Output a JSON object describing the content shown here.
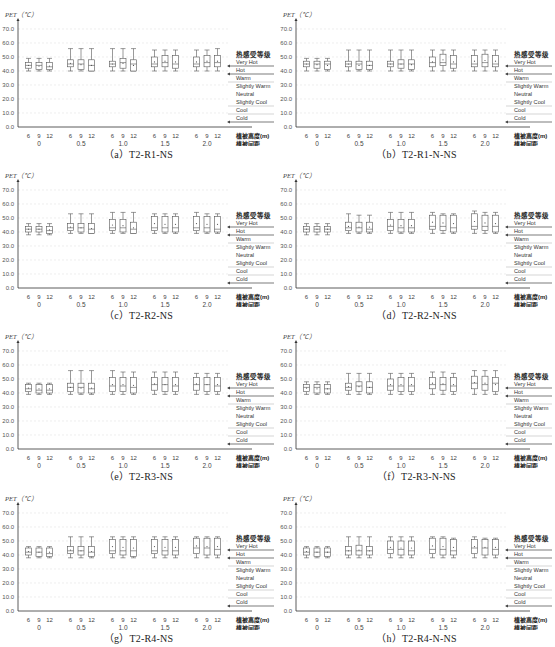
{
  "figure": {
    "y_axis_label": "PET（℃）",
    "y_ticks": [
      "0.0",
      "10.0",
      "20.0",
      "30.0",
      "40.0",
      "50.0",
      "60.0",
      "70.0"
    ],
    "x_sub_ticks": [
      "6",
      "9",
      "12"
    ],
    "x_groups": [
      "0",
      "0.5",
      "1.0",
      "1.5",
      "2.0"
    ],
    "x_label_height": "植被高度(m)",
    "x_label_spacing": "植被间距",
    "legend": {
      "title": "热感受等级",
      "levels": [
        "Very Hot",
        "Hot",
        "Warm",
        "Slightly Warm",
        "Neutral",
        "Slightly Cool",
        "Cool",
        "Cold"
      ]
    },
    "colors": {
      "box": "#555555",
      "axis": "#333333",
      "grid": "#e2e2e2",
      "legend_line": "#444444"
    }
  },
  "chart_data": [
    {
      "type": "boxplot",
      "title": "（a）T2-R1-NS",
      "ylabel": "PET（℃）",
      "ylim": [
        0,
        70
      ],
      "groups": [
        "0",
        "0.5",
        "1.0",
        "1.5",
        "2.0"
      ],
      "subgroups": [
        "6",
        "9",
        "12"
      ],
      "boxes": [
        [
          [
            40,
            42,
            44,
            46,
            49
          ],
          [
            40,
            41,
            44,
            46,
            49
          ],
          [
            40,
            41,
            43,
            46,
            49
          ]
        ],
        [
          [
            40,
            43,
            45,
            48,
            56
          ],
          [
            40,
            41,
            45,
            48,
            56
          ],
          [
            40,
            40,
            44,
            48,
            56
          ]
        ],
        [
          [
            40,
            43,
            45,
            47,
            56
          ],
          [
            40,
            42,
            46,
            49,
            56
          ],
          [
            40,
            40,
            45,
            48,
            56
          ]
        ],
        [
          [
            40,
            43,
            45,
            50,
            55
          ],
          [
            40,
            43,
            46,
            51,
            55
          ],
          [
            40,
            42,
            45,
            51,
            55
          ]
        ],
        [
          [
            40,
            43,
            45,
            50,
            55
          ],
          [
            40,
            43,
            46,
            51,
            55
          ],
          [
            40,
            43,
            46,
            51,
            56
          ]
        ]
      ]
    },
    {
      "type": "boxplot",
      "title": "（b）T2-R1-N-NS",
      "ylabel": "PET（℃）",
      "ylim": [
        0,
        70
      ],
      "groups": [
        "0",
        "0.5",
        "1.0",
        "1.5",
        "2.0"
      ],
      "subgroups": [
        "6",
        "9",
        "12"
      ],
      "boxes": [
        [
          [
            40,
            43,
            45,
            47,
            49
          ],
          [
            40,
            42,
            45,
            47,
            49
          ],
          [
            40,
            41,
            45,
            47,
            49
          ]
        ],
        [
          [
            40,
            43,
            45,
            47,
            55
          ],
          [
            40,
            41,
            45,
            47,
            55
          ],
          [
            40,
            41,
            44,
            47,
            55
          ]
        ],
        [
          [
            40,
            43,
            45,
            47,
            55
          ],
          [
            40,
            42,
            45,
            48,
            55
          ],
          [
            40,
            41,
            45,
            48,
            55
          ]
        ],
        [
          [
            40,
            43,
            46,
            50,
            55
          ],
          [
            40,
            44,
            46,
            52,
            55
          ],
          [
            40,
            42,
            45,
            51,
            55
          ]
        ],
        [
          [
            40,
            43,
            45,
            51,
            55
          ],
          [
            40,
            43,
            46,
            52,
            55
          ],
          [
            40,
            43,
            45,
            51,
            55
          ]
        ]
      ]
    },
    {
      "type": "boxplot",
      "title": "（c）T2-R2-NS",
      "ylabel": "PET（℃）",
      "ylim": [
        0,
        70
      ],
      "groups": [
        "0",
        "0.5",
        "1.0",
        "1.5",
        "2.0"
      ],
      "subgroups": [
        "6",
        "9",
        "12"
      ],
      "boxes": [
        [
          [
            38,
            40,
            42,
            44,
            46
          ],
          [
            38,
            40,
            42,
            44,
            46
          ],
          [
            38,
            39,
            41,
            44,
            46
          ]
        ],
        [
          [
            39,
            41,
            43,
            46,
            53
          ],
          [
            39,
            40,
            43,
            46,
            53
          ],
          [
            39,
            39,
            42,
            46,
            53
          ]
        ],
        [
          [
            39,
            41,
            43,
            49,
            54
          ],
          [
            39,
            40,
            43,
            49,
            54
          ],
          [
            39,
            39,
            42,
            47,
            54
          ]
        ],
        [
          [
            39,
            41,
            43,
            51,
            53
          ],
          [
            39,
            40,
            43,
            51,
            53
          ],
          [
            39,
            40,
            43,
            51,
            53
          ]
        ],
        [
          [
            39,
            41,
            43,
            51,
            54
          ],
          [
            39,
            40,
            43,
            51,
            53
          ],
          [
            39,
            40,
            42,
            51,
            53
          ]
        ]
      ]
    },
    {
      "type": "boxplot",
      "title": "（d）T2-R2-N-NS",
      "ylabel": "PET（℃）",
      "ylim": [
        0,
        70
      ],
      "groups": [
        "0",
        "0.5",
        "1.0",
        "1.5",
        "2.0"
      ],
      "subgroups": [
        "6",
        "9",
        "12"
      ],
      "boxes": [
        [
          [
            38,
            40,
            42,
            44,
            46
          ],
          [
            38,
            40,
            42,
            44,
            46
          ],
          [
            38,
            40,
            42,
            44,
            46
          ]
        ],
        [
          [
            39,
            41,
            43,
            47,
            53
          ],
          [
            39,
            40,
            43,
            47,
            52
          ],
          [
            39,
            40,
            42,
            47,
            52
          ]
        ],
        [
          [
            39,
            41,
            44,
            49,
            54
          ],
          [
            39,
            40,
            43,
            49,
            54
          ],
          [
            39,
            40,
            43,
            49,
            54
          ]
        ],
        [
          [
            39,
            42,
            44,
            52,
            54
          ],
          [
            39,
            41,
            44,
            52,
            53
          ],
          [
            39,
            40,
            43,
            52,
            53
          ]
        ],
        [
          [
            39,
            42,
            44,
            53,
            55
          ],
          [
            39,
            41,
            44,
            52,
            54
          ],
          [
            39,
            40,
            44,
            52,
            54
          ]
        ]
      ]
    },
    {
      "type": "boxplot",
      "title": "（e）T2-R3-NS",
      "ylabel": "PET（℃）",
      "ylim": [
        0,
        70
      ],
      "groups": [
        "0",
        "0.5",
        "1.0",
        "1.5",
        "2.0"
      ],
      "subgroups": [
        "6",
        "9",
        "12"
      ],
      "boxes": [
        [
          [
            39,
            41,
            43,
            46,
            47
          ],
          [
            39,
            40,
            42,
            46,
            47
          ],
          [
            39,
            40,
            42,
            46,
            47
          ]
        ],
        [
          [
            39,
            41,
            44,
            47,
            56
          ],
          [
            39,
            40,
            44,
            47,
            56
          ],
          [
            39,
            40,
            43,
            47,
            56
          ]
        ],
        [
          [
            39,
            41,
            45,
            51,
            56
          ],
          [
            39,
            41,
            45,
            51,
            55
          ],
          [
            39,
            40,
            44,
            51,
            55
          ]
        ],
        [
          [
            39,
            42,
            46,
            51,
            55
          ],
          [
            39,
            41,
            46,
            51,
            55
          ],
          [
            39,
            41,
            45,
            51,
            55
          ]
        ],
        [
          [
            39,
            42,
            46,
            51,
            54
          ],
          [
            39,
            41,
            46,
            51,
            54
          ],
          [
            39,
            41,
            45,
            51,
            54
          ]
        ]
      ]
    },
    {
      "type": "boxplot",
      "title": "（f）T2-R3-N-NS",
      "ylabel": "PET（℃）",
      "ylim": [
        0,
        70
      ],
      "groups": [
        "0",
        "0.5",
        "1.0",
        "1.5",
        "2.0"
      ],
      "subgroups": [
        "6",
        "9",
        "12"
      ],
      "boxes": [
        [
          [
            39,
            41,
            44,
            46,
            48
          ],
          [
            39,
            40,
            44,
            46,
            48
          ],
          [
            39,
            40,
            43,
            46,
            48
          ]
        ],
        [
          [
            39,
            42,
            44,
            47,
            54
          ],
          [
            39,
            41,
            45,
            48,
            54
          ],
          [
            39,
            40,
            44,
            48,
            54
          ]
        ],
        [
          [
            39,
            42,
            45,
            50,
            54
          ],
          [
            39,
            41,
            45,
            51,
            54
          ],
          [
            39,
            41,
            45,
            51,
            54
          ]
        ],
        [
          [
            39,
            43,
            46,
            51,
            55
          ],
          [
            39,
            42,
            46,
            51,
            55
          ],
          [
            39,
            41,
            45,
            51,
            54
          ]
        ],
        [
          [
            39,
            43,
            47,
            52,
            56
          ],
          [
            39,
            42,
            46,
            52,
            56
          ],
          [
            39,
            41,
            47,
            51,
            56
          ]
        ]
      ]
    },
    {
      "type": "boxplot",
      "title": "（g）T2-R4-NS",
      "ylabel": "PET（℃）",
      "ylim": [
        0,
        70
      ],
      "groups": [
        "0",
        "0.5",
        "1.0",
        "1.5",
        "2.0"
      ],
      "subgroups": [
        "6",
        "9",
        "12"
      ],
      "boxes": [
        [
          [
            38,
            40,
            42,
            45,
            46
          ],
          [
            38,
            39,
            42,
            45,
            46
          ],
          [
            38,
            39,
            41,
            45,
            46
          ]
        ],
        [
          [
            38,
            41,
            43,
            46,
            53
          ],
          [
            38,
            40,
            43,
            46,
            53
          ],
          [
            38,
            39,
            42,
            46,
            53
          ]
        ],
        [
          [
            38,
            41,
            43,
            51,
            53
          ],
          [
            38,
            40,
            43,
            51,
            53
          ],
          [
            38,
            39,
            43,
            51,
            53
          ]
        ],
        [
          [
            38,
            41,
            43,
            51,
            53
          ],
          [
            38,
            40,
            43,
            51,
            53
          ],
          [
            38,
            40,
            43,
            51,
            53
          ]
        ],
        [
          [
            38,
            41,
            45,
            52,
            53
          ],
          [
            38,
            40,
            45,
            52,
            53
          ],
          [
            38,
            40,
            44,
            52,
            53
          ]
        ]
      ]
    },
    {
      "type": "boxplot",
      "title": "（h）T2-R4-N-NS",
      "ylabel": "PET（℃）",
      "ylim": [
        0,
        70
      ],
      "groups": [
        "0",
        "0.5",
        "1.0",
        "1.5",
        "2.0"
      ],
      "subgroups": [
        "6",
        "9",
        "12"
      ],
      "boxes": [
        [
          [
            38,
            40,
            42,
            45,
            46
          ],
          [
            38,
            39,
            42,
            45,
            46
          ],
          [
            38,
            39,
            42,
            45,
            46
          ]
        ],
        [
          [
            38,
            40,
            43,
            46,
            53
          ],
          [
            38,
            40,
            43,
            47,
            53
          ],
          [
            38,
            40,
            43,
            46,
            53
          ]
        ],
        [
          [
            38,
            41,
            44,
            50,
            53
          ],
          [
            38,
            40,
            44,
            50,
            53
          ],
          [
            38,
            40,
            43,
            50,
            53
          ]
        ],
        [
          [
            38,
            41,
            44,
            52,
            53
          ],
          [
            38,
            40,
            44,
            52,
            53
          ],
          [
            38,
            40,
            43,
            51,
            52
          ]
        ],
        [
          [
            38,
            41,
            45,
            51,
            53
          ],
          [
            38,
            40,
            45,
            51,
            52
          ],
          [
            38,
            40,
            44,
            51,
            52
          ]
        ]
      ]
    }
  ]
}
